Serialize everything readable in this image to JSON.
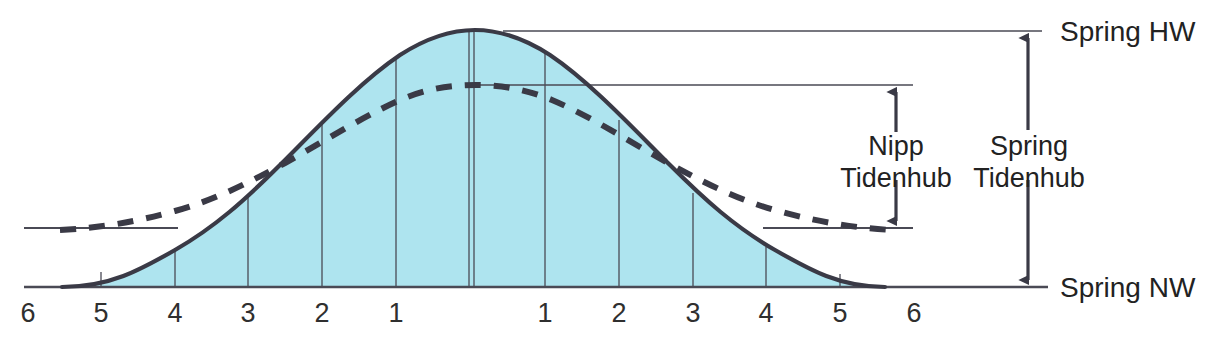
{
  "figure": {
    "colors": {
      "water_fill": "#aee4ef",
      "curve": "#3a3a46",
      "thin_line": "#4a4a55",
      "text": "#222222",
      "background": "#ffffff"
    }
  },
  "labels": {
    "spring_hw": "Spring HW",
    "spring_nw": "Spring NW",
    "nipp_tidenhub_line1": "Nipp",
    "nipp_tidenhub_line2": "Tidenhub",
    "spring_tidenhub_line1": "Spring",
    "spring_tidenhub_line2": "Tidenhub"
  },
  "axis": {
    "ticks_left": [
      "6",
      "5",
      "4",
      "3",
      "2",
      "1"
    ],
    "ticks_right": [
      "1",
      "2",
      "3",
      "4",
      "5",
      "6"
    ],
    "tick_x_left": [
      28,
      101,
      175,
      248,
      322,
      396
    ],
    "tick_x_right": [
      545,
      619,
      693,
      766,
      840,
      914
    ],
    "label_y": 300
  },
  "chart_data": {
    "type": "area",
    "xlabel": "",
    "ylabel": "",
    "x": [
      -6,
      -5,
      -4,
      -3,
      -2,
      -1,
      0,
      1,
      2,
      3,
      4,
      5,
      6
    ],
    "series": [
      {
        "name": "Spring tide (Springtide)",
        "style": "solid",
        "values": [
          0,
          0.04,
          0.18,
          0.44,
          0.73,
          0.93,
          1.0,
          0.93,
          0.73,
          0.44,
          0.18,
          0.04,
          0
        ]
      },
      {
        "name": "Neap tide (Nipptide)",
        "style": "dashed",
        "values": [
          0.27,
          0.29,
          0.36,
          0.52,
          0.67,
          0.76,
          0.79,
          0.76,
          0.67,
          0.52,
          0.36,
          0.29,
          0.27
        ]
      }
    ],
    "reference_levels": [
      {
        "name": "Spring HW",
        "value": 1.0
      },
      {
        "name": "Nipp HW",
        "value": 0.79
      },
      {
        "name": "Nipp NW",
        "value": 0.23
      },
      {
        "name": "Spring NW",
        "value": 0.0
      }
    ],
    "ranges": [
      {
        "name": "Spring Tidenhub",
        "from": "Spring NW",
        "to": "Spring HW"
      },
      {
        "name": "Nipp Tidenhub",
        "from": "Nipp NW",
        "to": "Nipp HW"
      }
    ],
    "grid": true,
    "legend": "none"
  }
}
